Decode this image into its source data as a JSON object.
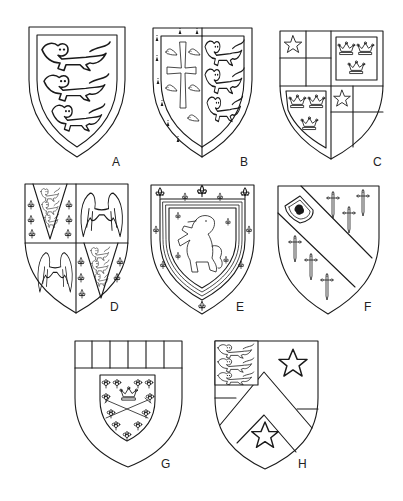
{
  "figure": {
    "shields": [
      {
        "label": "A",
        "description": "Three lions passant guardant within a bordure"
      },
      {
        "label": "B",
        "description": "Impaled: cross flory between martlets with ermine bordure; three lions passant guardant"
      },
      {
        "label": "C",
        "description": "Quarterly: checky with mullet; three crowns"
      },
      {
        "label": "D",
        "description": "Quarterly: fleurs-de-lis with pile of lions; pair of wings"
      },
      {
        "label": "E",
        "description": "Lion rampant within a double tressure flory counter-flory"
      },
      {
        "label": "F",
        "description": "Bend with escutcheon between six cross crosslets fitchy"
      },
      {
        "label": "G",
        "description": "Chief paly with escutcheon bearing crown and crossed swords among flowers"
      },
      {
        "label": "H",
        "description": "Chevron between two mullets with canton of three lions"
      }
    ]
  },
  "colors": {
    "ink": "#1a1a1a",
    "background": "#ffffff"
  }
}
